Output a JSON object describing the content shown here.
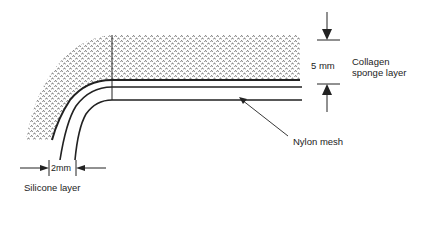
{
  "diagram": {
    "type": "cross-section",
    "labels": {
      "dimension_thickness": "5 mm",
      "collagen_line1": "Collagen",
      "collagen_line2": "sponge layer",
      "nylon": "Nylon mesh",
      "dimension_width": "2mm",
      "silicone": "Silicone layer"
    },
    "layers": [
      {
        "name": "Collagen sponge layer",
        "thickness": "5 mm",
        "pattern": "stippled"
      },
      {
        "name": "Nylon mesh",
        "pattern": "line"
      },
      {
        "name": "Silicone layer",
        "thickness": "2mm",
        "pattern": "double line"
      }
    ],
    "colors": {
      "ink": "#222222",
      "background": "#ffffff"
    }
  }
}
